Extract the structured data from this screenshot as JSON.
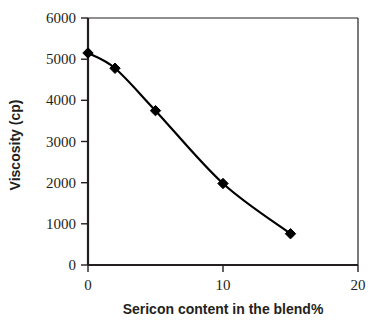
{
  "chart_data": {
    "type": "line",
    "title": "",
    "xlabel": "Sericon content in the blend%",
    "ylabel": "Viscosity (cp)",
    "xlim": [
      0,
      20
    ],
    "ylim": [
      0,
      6000
    ],
    "xticks": [
      0,
      10,
      20
    ],
    "yticks": [
      0,
      1000,
      2000,
      3000,
      4000,
      5000,
      6000
    ],
    "xtick_labels": [
      "0",
      "10",
      "20"
    ],
    "ytick_labels": [
      "0",
      "1000",
      "2000",
      "3000",
      "4000",
      "5000",
      "6000"
    ],
    "grid": false,
    "legend": false,
    "legend_position": "none",
    "marker": "filled-diamond",
    "line_color": "#000000",
    "marker_color": "#000000",
    "background_color": "#ffffff",
    "axis_color": "#231f20",
    "x": [
      0,
      2,
      5,
      10,
      15
    ],
    "values": [
      5150,
      4780,
      3750,
      1980,
      760
    ],
    "series": [
      {
        "name": "Viscosity",
        "x": [
          0,
          2,
          5,
          10,
          15
        ],
        "values": [
          5150,
          4780,
          3750,
          1980,
          760
        ]
      }
    ],
    "points": [
      {
        "x": 0,
        "y": 5150
      },
      {
        "x": 2,
        "y": 4780
      },
      {
        "x": 5,
        "y": 3750
      },
      {
        "x": 10,
        "y": 1980
      },
      {
        "x": 15,
        "y": 760
      }
    ]
  }
}
